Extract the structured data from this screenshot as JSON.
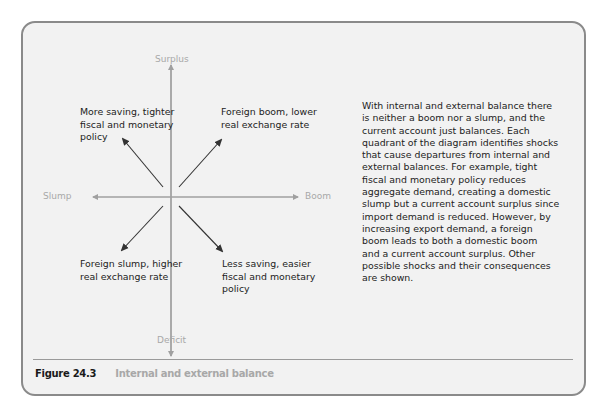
{
  "figure": {
    "number": "Figure 24.3",
    "title": "Internal and external balance"
  },
  "axes": {
    "top": "Surplus",
    "bottom": "Deficit",
    "left": "Slump",
    "right": "Boom"
  },
  "quadrants": {
    "top_left": [
      "More saving, tighter",
      "fiscal and monetary",
      "policy"
    ],
    "top_right": [
      "Foreign boom, lower",
      "real exchange rate"
    ],
    "bottom_left": [
      "Foreign slump, higher",
      "real exchange rate"
    ],
    "bottom_right": [
      "Less saving, easier",
      "fiscal and monetary",
      "policy"
    ]
  },
  "description": [
    "With internal and external balance there",
    "is neither a boom nor a slump, and the",
    "current account just balances. Each",
    "quadrant of the diagram identifies shocks",
    "that cause departures from internal and",
    "external balances. For example, tight",
    "fiscal and monetary policy reduces",
    "aggregate demand, creating a domestic",
    "slump but a current account surplus since",
    "import demand is reduced. However, by",
    "increasing export demand, a foreign",
    "boom leads to both a domestic boom",
    "and a current account surplus. Other",
    "possible shocks and their consequences",
    "are shown."
  ],
  "colors": {
    "panel_bg": "#f2f2f2",
    "panel_border": "#8a8a8a",
    "axis": "#a0a0a0",
    "arrow": "#333333",
    "caption_title": "#a8a8a8"
  }
}
